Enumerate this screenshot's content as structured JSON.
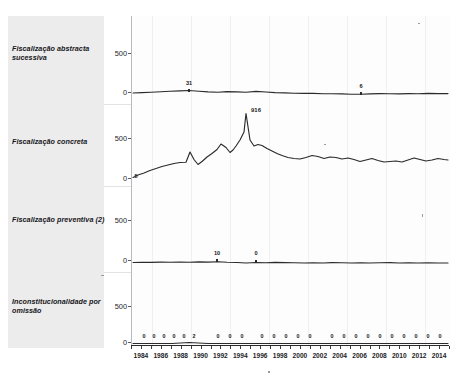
{
  "chart_data": {
    "type": "line",
    "title": "",
    "subtitle": "",
    "xlabel": "",
    "ylabel": "",
    "grid": true,
    "legend_position": "none",
    "layout": "small-multiples, 4 stacked panels sharing one x-axis",
    "x": [
      1983,
      1984,
      1985,
      1986,
      1987,
      1988,
      1989,
      1990,
      1991,
      1992,
      1993,
      1994,
      1995,
      1996,
      1997,
      1998,
      1999,
      2000,
      2001,
      2002,
      2003,
      2004,
      2005,
      2006,
      2007,
      2008,
      2009,
      2010,
      2011,
      2012,
      2013,
      2014,
      2015
    ],
    "xlim": [
      1983,
      2015
    ],
    "ylim": [
      0,
      1000
    ],
    "yticks": [
      0,
      500
    ],
    "ytick_labels": [
      "0",
      "500"
    ],
    "xtick_labels": [
      "1984",
      "1986",
      "1988",
      "1990",
      "1992",
      "1994",
      "1996",
      "1998",
      "2000",
      "2002",
      "2004",
      "2006",
      "2008",
      "2010",
      "2012",
      "2014"
    ],
    "xticks": [
      1984,
      1986,
      1988,
      1990,
      1992,
      1994,
      1996,
      1998,
      2000,
      2002,
      2004,
      2006,
      2008,
      2010,
      2012,
      2014
    ],
    "panels": [
      {
        "name": "Fiscalização abstracta sucessiva",
        "label": "Fiscalização abstracta sucessiva",
        "values": [
          8,
          12,
          16,
          20,
          24,
          28,
          31,
          26,
          22,
          20,
          24,
          22,
          20,
          26,
          22,
          18,
          16,
          14,
          12,
          12,
          10,
          9,
          8,
          6,
          6,
          8,
          10,
          9,
          8,
          10,
          9,
          11,
          10
        ],
        "annotations": [
          {
            "x": 1989,
            "y": 31,
            "text": "31"
          },
          {
            "x": 2007,
            "y": 6,
            "text": "6"
          }
        ]
      },
      {
        "name": "Fiscalização concreta",
        "label": "Fiscalização concreta",
        "values": [
          5,
          30,
          55,
          80,
          105,
          130,
          170,
          400,
          215,
          180,
          300,
          340,
          470,
          560,
          430,
          480,
          570,
          916,
          400,
          480,
          430,
          390,
          340,
          300,
          280,
          310,
          290,
          270,
          300,
          290,
          270,
          230,
          250,
          240,
          270,
          250,
          230,
          260
        ],
        "annotations": [
          {
            "x": 1996,
            "y": 916,
            "text": "916"
          },
          {
            "x": 1983,
            "y": 5,
            "text": "5"
          }
        ]
      },
      {
        "name": "Fiscalização preventiva (2)",
        "label": "Fiscalização preventiva (2)",
        "values": [
          4,
          6,
          5,
          7,
          6,
          8,
          7,
          9,
          8,
          10,
          7,
          6,
          0,
          4,
          3,
          5,
          4,
          3,
          2,
          3,
          2,
          4,
          3,
          2,
          3,
          2,
          3,
          4,
          2,
          3,
          2,
          3,
          2
        ],
        "annotations": [
          {
            "x": 1992,
            "y": 10,
            "text": "10"
          },
          {
            "x": 1996,
            "y": 0,
            "text": "0"
          }
        ]
      },
      {
        "name": "Inconstitucionalidade por omissão",
        "label": "Inconstitucionalidade por omissão",
        "values": [
          0,
          0,
          0,
          0,
          0,
          0,
          2,
          0,
          0,
          0,
          0,
          0,
          0,
          0,
          0,
          0,
          0,
          0,
          0,
          0,
          0,
          0,
          0,
          0,
          0,
          0,
          0,
          0,
          0,
          0,
          0,
          0,
          0
        ],
        "point_labels": [
          "0",
          "0",
          "0",
          "0",
          "0",
          "2",
          "0",
          "0",
          "0",
          "0",
          "0",
          "0",
          "0",
          "0",
          "0",
          "0",
          "0",
          "0",
          "0",
          "0",
          "0",
          "0",
          "0",
          "0",
          "0",
          "0"
        ],
        "annotations": []
      }
    ]
  },
  "axis": {
    "ytick_top": "500",
    "ytick_bottom": "0"
  }
}
